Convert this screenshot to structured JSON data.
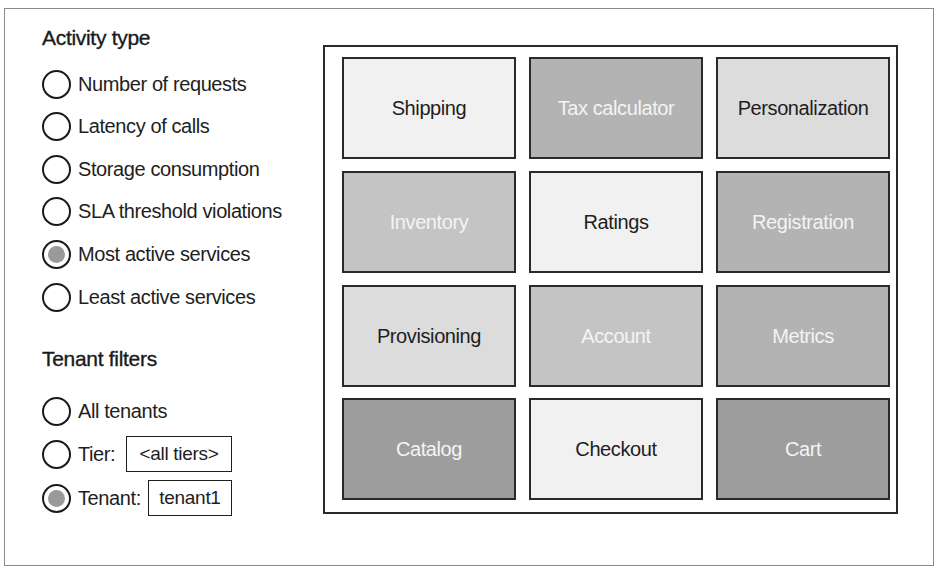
{
  "activity_type": {
    "title": "Activity type",
    "options": [
      {
        "label": "Number of requests",
        "checked": false
      },
      {
        "label": "Latency of calls",
        "checked": false
      },
      {
        "label": "Storage consumption",
        "checked": false
      },
      {
        "label": "SLA threshold violations",
        "checked": false
      },
      {
        "label": "Most active services",
        "checked": true
      },
      {
        "label": "Least active services",
        "checked": false
      }
    ]
  },
  "tenant_filters": {
    "title": "Tenant filters",
    "all_tenants": {
      "label": "All tenants",
      "checked": false
    },
    "tier": {
      "label": "Tier:",
      "value": "<all tiers>",
      "checked": false
    },
    "tenant": {
      "label": "Tenant:",
      "value": "tenant1",
      "checked": true
    }
  },
  "colors": {
    "tile_lightest": "#f1f1f1",
    "tile_light": "#dcdcdc",
    "tile_medium": "#c4c4c4",
    "tile_medium_dark": "#b3b3b3",
    "tile_dark": "#9d9d9d",
    "text_dark": "#1e1e1e",
    "text_light": "#f4f4f4"
  },
  "heatmap": {
    "tiles": [
      {
        "label": "Shipping",
        "shade": "lightest",
        "text": "dark"
      },
      {
        "label": "Tax calculator",
        "shade": "medium_dark",
        "text": "light"
      },
      {
        "label": "Personalization",
        "shade": "light",
        "text": "dark"
      },
      {
        "label": "Inventory",
        "shade": "medium",
        "text": "light"
      },
      {
        "label": "Ratings",
        "shade": "lightest",
        "text": "dark"
      },
      {
        "label": "Registration",
        "shade": "medium_dark",
        "text": "light"
      },
      {
        "label": "Provisioning",
        "shade": "light",
        "text": "dark"
      },
      {
        "label": "Account",
        "shade": "medium",
        "text": "light"
      },
      {
        "label": "Metrics",
        "shade": "medium_dark",
        "text": "light"
      },
      {
        "label": "Catalog",
        "shade": "dark",
        "text": "light"
      },
      {
        "label": "Checkout",
        "shade": "lightest",
        "text": "dark"
      },
      {
        "label": "Cart",
        "shade": "dark",
        "text": "light"
      }
    ]
  }
}
